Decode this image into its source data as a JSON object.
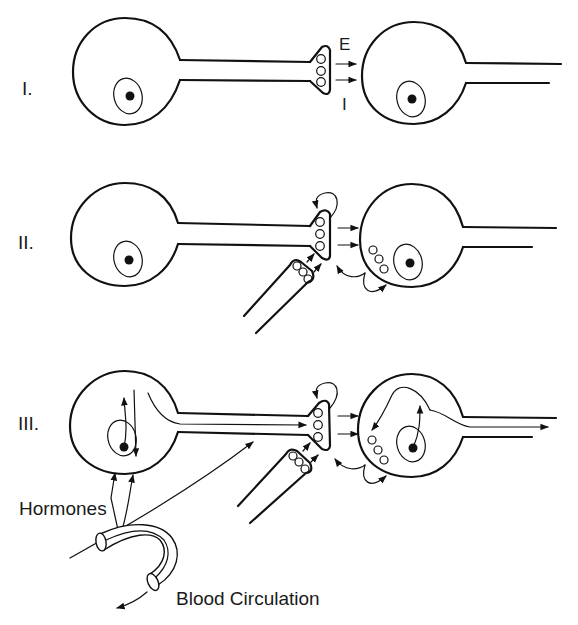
{
  "diagram": {
    "panels": [
      {
        "label": "I.",
        "description": "Simple synapse between presynaptic and postsynaptic neuron"
      },
      {
        "label": "II.",
        "description": "Synapse with presynaptic axo-axonic modulation and feedback"
      },
      {
        "label": "III.",
        "description": "Synapse with modulation, axonal transport and hormonal influence"
      }
    ],
    "synapse_labels": {
      "excitatory": "E",
      "inhibitory": "I"
    },
    "annotations": {
      "hormones": "Hormones",
      "blood_circulation": "Blood Circulation"
    },
    "colors": {
      "ink": "#111111",
      "background": "#ffffff"
    }
  }
}
